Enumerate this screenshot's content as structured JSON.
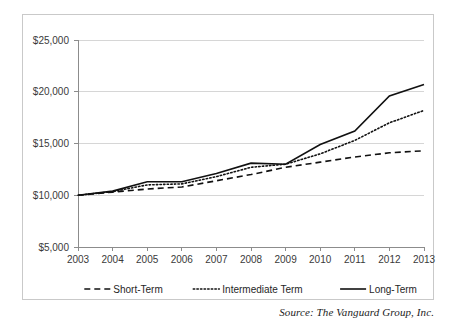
{
  "figure": {
    "source_note": "Source: The Vanguard Group, Inc."
  },
  "chart_data": {
    "type": "line",
    "title": "",
    "xlabel": "",
    "ylabel": "",
    "grid": true,
    "legend_position": "bottom",
    "x": [
      2003,
      2004,
      2005,
      2006,
      2007,
      2008,
      2009,
      2010,
      2011,
      2012,
      2013
    ],
    "categories": [
      "2003",
      "2004",
      "2005",
      "2006",
      "2007",
      "2008",
      "2009",
      "2010",
      "2011",
      "2012",
      "2013"
    ],
    "xtick_labels": [
      "2003",
      "2004",
      "2005",
      "2006",
      "2007",
      "2008",
      "2009",
      "2010",
      "2011",
      "2012",
      "2013"
    ],
    "ytick_labels": [
      "$5,000",
      "$10,000",
      "$15,000",
      "$20,000",
      "$25,000"
    ],
    "ytick_values": [
      5000,
      10000,
      15000,
      20000,
      25000
    ],
    "ylim": [
      5000,
      25000
    ],
    "xlim": [
      2003,
      2013
    ],
    "series": [
      {
        "name": "Short-Term",
        "style": "dashed",
        "color": "#111111",
        "values": [
          10000,
          10300,
          10600,
          10800,
          11400,
          12000,
          12700,
          13200,
          13700,
          14100,
          14300
        ]
      },
      {
        "name": "Intermediate Term",
        "style": "dotted",
        "color": "#111111",
        "values": [
          10000,
          10350,
          11000,
          11100,
          11800,
          12700,
          13000,
          14000,
          15300,
          17000,
          18200
        ]
      },
      {
        "name": "Long-Term",
        "style": "solid",
        "color": "#111111",
        "values": [
          10000,
          10400,
          11300,
          11300,
          12100,
          13100,
          13000,
          14900,
          16200,
          19600,
          20700
        ]
      }
    ],
    "legend": [
      {
        "label": "Short-Term",
        "style": "dashed"
      },
      {
        "label": "Intermediate Term",
        "style": "dotted"
      },
      {
        "label": "Long-Term",
        "style": "solid"
      }
    ]
  }
}
